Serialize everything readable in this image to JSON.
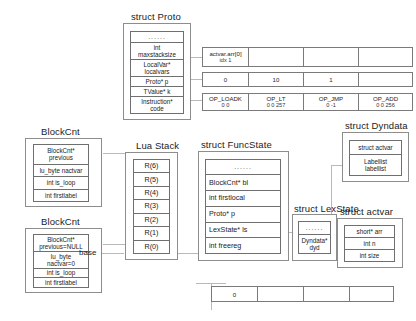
{
  "diagram": {
    "title_proto": "struct Proto",
    "title_blockcnt_1": "BlockCnt",
    "title_blockcnt_2": "BlockCnt",
    "title_luastack": "Lua Stack",
    "title_funcstate": "struct FuncState",
    "title_lexstate": "struct LexState",
    "title_dyndata": "struct Dyndata",
    "title_actvar": "struct actvar",
    "base_label": "base"
  },
  "proto": {
    "fields": [
      "......",
      "int\nmaxstacksize",
      "LocalVar*\nlocalvars",
      "Proto* p",
      "TValue* k",
      "Instruction*\ncode"
    ]
  },
  "blockcnt1": {
    "fields": [
      "BlockCnt*\nprevious",
      "lu_byte nactvar",
      "int is_loop",
      "int firstlabel"
    ]
  },
  "blockcnt2": {
    "fields": [
      "BlockCnt*\nprevious=NULL",
      "lu_byte\nnactvar=0",
      "int is_loop",
      "int firstlabel"
    ]
  },
  "luastack": {
    "registers": [
      "R(6)",
      "R(5)",
      "R(4)",
      "R(3)",
      "R(2)",
      "R(1)",
      "R(0)"
    ]
  },
  "funcstate": {
    "fields": [
      "......",
      "BlockCnt* bl",
      "int firstlocal",
      "Proto* p",
      "LexState* ls",
      "int freereg"
    ]
  },
  "lexstate": {
    "fields": [
      "......",
      "Dyndata*\ndyd"
    ]
  },
  "dyndata": {
    "fields": [
      "struct actvar",
      "Labellist\nlabellist"
    ]
  },
  "actvar": {
    "fields": [
      "short* arr",
      "int n",
      "int size"
    ]
  },
  "actvar_array": {
    "cells": [
      {
        "line1": "actvar.arr[0]",
        "line2": "idx 1"
      },
      {
        "line1": "",
        "line2": ""
      },
      {
        "line1": "",
        "line2": ""
      },
      {
        "line1": "",
        "line2": ""
      }
    ]
  },
  "k_array": {
    "cells": [
      {
        "line1": "0",
        "line2": ""
      },
      {
        "line1": "10",
        "line2": ""
      },
      {
        "line1": "1",
        "line2": ""
      },
      {
        "line1": "",
        "line2": ""
      }
    ]
  },
  "code_array": {
    "cells": [
      {
        "line1": "OP_LOADK",
        "line2": "0 0"
      },
      {
        "line1": "OP_LT",
        "line2": "0 0 257"
      },
      {
        "line1": "OP_JMP",
        "line2": "0 -1"
      },
      {
        "line1": "OP_ADD",
        "line2": "0 0 256"
      }
    ]
  },
  "bottom_array": {
    "cells": [
      {
        "line1": "0",
        "line2": ""
      },
      {
        "line1": "",
        "line2": ""
      },
      {
        "line1": "",
        "line2": ""
      },
      {
        "line1": "",
        "line2": ""
      }
    ]
  }
}
